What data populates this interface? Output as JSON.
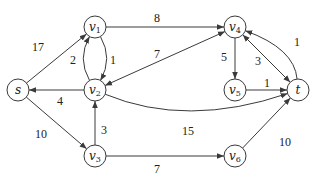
{
  "diagram": {
    "type": "directed weighted graph",
    "colors": {
      "stroke": "#3a3a3a",
      "background": "#ffffff",
      "text": "#222222"
    },
    "nodes": [
      {
        "id": "s",
        "base": "s",
        "sub": "",
        "x": 18,
        "y": 90
      },
      {
        "id": "v1",
        "base": "v",
        "sub": "1",
        "x": 95,
        "y": 27
      },
      {
        "id": "v2",
        "base": "v",
        "sub": "2",
        "x": 95,
        "y": 90
      },
      {
        "id": "v3",
        "base": "v",
        "sub": "3",
        "x": 95,
        "y": 156
      },
      {
        "id": "v4",
        "base": "v",
        "sub": "4",
        "x": 235,
        "y": 27
      },
      {
        "id": "v5",
        "base": "v",
        "sub": "5",
        "x": 235,
        "y": 90
      },
      {
        "id": "v6",
        "base": "v",
        "sub": "6",
        "x": 235,
        "y": 156
      },
      {
        "id": "t",
        "base": "t",
        "sub": "",
        "x": 298,
        "y": 90
      }
    ],
    "edges": [
      {
        "from": "s",
        "to": "v1",
        "weight": "17",
        "lx": 38,
        "ly": 47
      },
      {
        "from": "s",
        "to": "v3",
        "weight": "10",
        "lx": 41,
        "ly": 134
      },
      {
        "from": "v2",
        "to": "s",
        "weight": "4",
        "lx": 60,
        "ly": 101
      },
      {
        "from": "v2",
        "to": "v1",
        "weight": "2",
        "lx": 73,
        "ly": 60,
        "curve": "left"
      },
      {
        "from": "v1",
        "to": "v2",
        "weight": "1",
        "lx": 113,
        "ly": 60,
        "curve": "right"
      },
      {
        "from": "v1",
        "to": "v4",
        "weight": "8",
        "lx": 157,
        "ly": 18
      },
      {
        "from": "v4",
        "to": "v2",
        "weight": "7",
        "lx": 157,
        "ly": 54,
        "bidirectional": true
      },
      {
        "from": "v3",
        "to": "v2",
        "weight": "3",
        "lx": 104,
        "ly": 130
      },
      {
        "from": "v2",
        "to": "t",
        "weight": "15",
        "lx": 188,
        "ly": 131,
        "curve": "down"
      },
      {
        "from": "v3",
        "to": "v6",
        "weight": "7",
        "lx": 157,
        "ly": 169
      },
      {
        "from": "v4",
        "to": "v5",
        "weight": "5",
        "lx": 224,
        "ly": 57
      },
      {
        "from": "v4",
        "to": "t",
        "weight": "3",
        "lx": 258,
        "ly": 61,
        "bidirectional": true
      },
      {
        "from": "t",
        "to": "v4",
        "weight": "1",
        "lx": 297,
        "ly": 42,
        "curve": "up"
      },
      {
        "from": "v5",
        "to": "t",
        "weight": "1",
        "lx": 267,
        "ly": 83
      },
      {
        "from": "v6",
        "to": "t",
        "weight": "10",
        "lx": 285,
        "ly": 142
      }
    ]
  }
}
